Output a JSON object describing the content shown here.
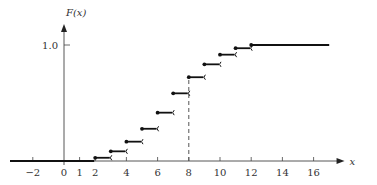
{
  "chart_data": {
    "type": "line",
    "subtype": "step-cdf",
    "title": "",
    "xlabel": "x",
    "ylabel": "F(x)",
    "x_ticks": [
      -2,
      0,
      1,
      2,
      4,
      6,
      8,
      10,
      12,
      14,
      16
    ],
    "y_ticks": [
      {
        "value": 1.0,
        "label": "1.0"
      }
    ],
    "xlim": [
      -3.3,
      17.8
    ],
    "ylim": [
      0,
      1.1
    ],
    "grid": false,
    "legend": null,
    "steps": [
      {
        "x_start": -3.3,
        "x_end": 2,
        "y": 0.0
      },
      {
        "x_start": 2,
        "x_end": 3,
        "y": 0.0278
      },
      {
        "x_start": 3,
        "x_end": 4,
        "y": 0.0833
      },
      {
        "x_start": 4,
        "x_end": 5,
        "y": 0.1667
      },
      {
        "x_start": 5,
        "x_end": 6,
        "y": 0.2778
      },
      {
        "x_start": 6,
        "x_end": 7,
        "y": 0.4167
      },
      {
        "x_start": 7,
        "x_end": 8,
        "y": 0.5833
      },
      {
        "x_start": 8,
        "x_end": 9,
        "y": 0.7222
      },
      {
        "x_start": 9,
        "x_end": 10,
        "y": 0.8333
      },
      {
        "x_start": 10,
        "x_end": 11,
        "y": 0.9167
      },
      {
        "x_start": 11,
        "x_end": 12,
        "y": 0.9722
      },
      {
        "x_start": 12,
        "x_end": 17,
        "y": 1.0
      }
    ],
    "annotations": [
      {
        "type": "dashed-vertical",
        "x": 8,
        "y_from": 0,
        "y_to": 0.7222
      }
    ]
  },
  "colors": {
    "line": "#111111",
    "axis": "#444444",
    "text": "#333333"
  }
}
